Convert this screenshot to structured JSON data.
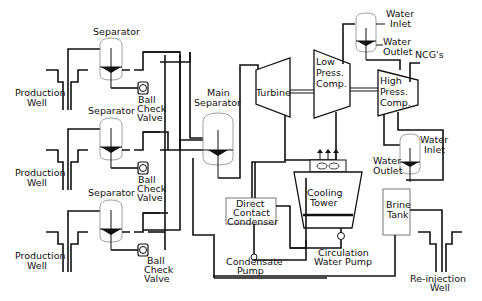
{
  "diagram": {
    "components": {
      "production_wells": [
        {
          "label_line1": "Production",
          "label_line2": "Well"
        },
        {
          "label_line1": "Production",
          "label_line2": "Well"
        },
        {
          "label_line1": "Production",
          "label_line2": "Well"
        }
      ],
      "separators": [
        {
          "label": "Separator"
        },
        {
          "label": "Separator"
        },
        {
          "label": "Separator"
        }
      ],
      "ball_check_valves": [
        {
          "line1": "Ball",
          "line2": "Check",
          "line3": "Valve"
        },
        {
          "line1": "Ball",
          "line2": "Check",
          "line3": "Valve"
        },
        {
          "line1": "Ball",
          "line2": "Check",
          "line3": "Valve"
        }
      ],
      "main_separator": {
        "line1": "Main",
        "line2": "Separator"
      },
      "turbine": {
        "label": "Turbine"
      },
      "low_press_comp": {
        "line1": "Low",
        "line2": "Press.",
        "line3": "Comp."
      },
      "high_press_comp": {
        "line1": "High",
        "line2": "Press.",
        "line3": "Comp."
      },
      "upper_intercooler": {
        "inlet1": "Water",
        "inlet2": "Inlet",
        "outlet1": "Water",
        "outlet2": "Outlet"
      },
      "lower_intercooler": {
        "inlet1": "Water",
        "inlet2": "Inlet",
        "outlet1": "Water",
        "outlet2": "Outlet"
      },
      "ncg": {
        "label": "NCG's"
      },
      "condenser": {
        "line1": "Direct",
        "line2": "Contact",
        "line3": "Condenser"
      },
      "cooling_tower": {
        "line1": "Cooling",
        "line2": "Tower"
      },
      "brine_tank": {
        "line1": "Brine",
        "line2": "Tank"
      },
      "condensate_pump": {
        "line1": "Condensate",
        "line2": "Pump"
      },
      "circulation_pump": {
        "line1": "Circulation",
        "line2": "Water  Pump"
      },
      "reinjection_well": {
        "line1": "Re-injection",
        "line2": "Well"
      }
    },
    "colors": {
      "line": "#111111",
      "vessel_outline": "#888888",
      "box_outline": "#666666"
    }
  }
}
